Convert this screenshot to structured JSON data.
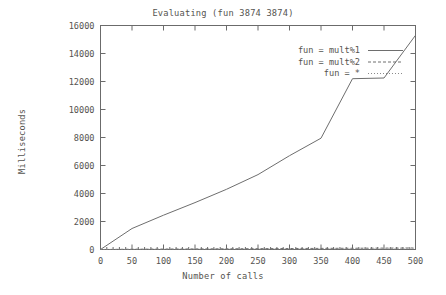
{
  "chart_data": {
    "type": "line",
    "title": "Evaluating (fun 3874 3874)",
    "xlabel": "Number of calls",
    "ylabel": "Milliseconds",
    "xlim": [
      0,
      500
    ],
    "ylim": [
      0,
      16000
    ],
    "grid": false,
    "legend_position": "top-right-inside",
    "xticks": [
      0,
      50,
      100,
      150,
      200,
      250,
      300,
      350,
      400,
      450,
      500
    ],
    "xtick_labels": [
      "0",
      "50",
      "100",
      "150",
      "200",
      "250",
      "300",
      "350",
      "400",
      "450",
      "500"
    ],
    "yticks": [
      0,
      2000,
      4000,
      6000,
      8000,
      10000,
      12000,
      14000,
      16000
    ],
    "ytick_labels": [
      "0",
      "2000",
      "4000",
      "6000",
      "8000",
      "10000",
      "12000",
      "14000",
      "16000"
    ],
    "x": [
      0,
      50,
      100,
      150,
      200,
      250,
      300,
      350,
      400,
      450,
      500
    ],
    "series": [
      {
        "name": "fun = mult%1",
        "style": "solid",
        "color": "#6e6e6e",
        "values": [
          0,
          1500,
          2450,
          3350,
          4300,
          5350,
          6700,
          7950,
          12200,
          12250,
          15300
        ]
      },
      {
        "name": "fun = mult%2",
        "style": "dashed",
        "color": "#6e6e6e",
        "values": [
          0,
          20,
          30,
          40,
          50,
          60,
          70,
          80,
          90,
          100,
          110
        ]
      },
      {
        "name": "fun = *",
        "style": "dotted",
        "color": "#8a8a8a",
        "values": [
          0,
          10,
          15,
          20,
          25,
          30,
          35,
          40,
          45,
          50,
          55
        ]
      }
    ]
  },
  "legend": {
    "entries": [
      {
        "label": "fun = mult%1"
      },
      {
        "label": "fun = mult%2"
      },
      {
        "label": "fun = *"
      }
    ]
  }
}
